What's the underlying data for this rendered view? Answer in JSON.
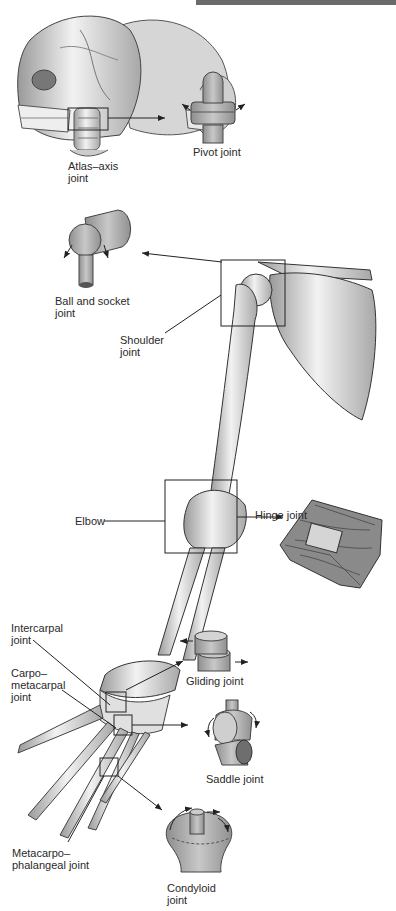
{
  "figure": {
    "header_bar_color": "#6b6b6b",
    "labels": {
      "atlas_axis": "Atlas–axis\njoint",
      "pivot": "Pivot joint",
      "ball_socket": "Ball and socket\njoint",
      "shoulder": "Shoulder\njoint",
      "elbow": "Elbow",
      "hinge": "Hinge joint",
      "intercarpal": "Intercarpal\njoint",
      "carpometacarpal": "Carpo–\nmetacarpal\njoint",
      "gliding": "Gliding joint",
      "saddle": "Saddle joint",
      "metacarpophalangeal": "Metacarpo–\nphalangeal joint",
      "condyloid": "Condyloid\njoint"
    }
  }
}
